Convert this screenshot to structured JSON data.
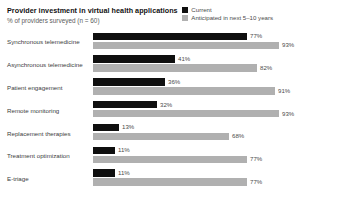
{
  "header": {
    "title": "Provider investment in virtual health applications",
    "subtitle": "% of providers surveyed (n = 60)"
  },
  "legend": {
    "items": [
      {
        "label": "Current",
        "color": "#0f0f0f",
        "swatch_name": "legend-swatch-current"
      },
      {
        "label": "Anticipated in next 5–10 years",
        "color": "#b0b0b0",
        "swatch_name": "legend-swatch-anticipated"
      }
    ]
  },
  "chart_data": {
    "type": "bar",
    "orientation": "horizontal",
    "title": "Provider investment in virtual health applications",
    "subtitle": "% of providers surveyed (n = 60)",
    "xlabel": "",
    "ylabel": "",
    "xlim": [
      0,
      100
    ],
    "grid": false,
    "legend_position": "top-right",
    "categories": [
      "Synchronous telemedicine",
      "Asynchronous telemedicine",
      "Patient engagement",
      "Remote monitoring",
      "Replacement therapies",
      "Treatment optimization",
      "E-triage"
    ],
    "series": [
      {
        "name": "Current",
        "color": "#0f0f0f",
        "values": [
          77,
          41,
          36,
          32,
          13,
          11,
          11
        ],
        "labels": [
          "77%",
          "41%",
          "36%",
          "32%",
          "13%",
          "11%",
          "11%"
        ]
      },
      {
        "name": "Anticipated in next 5–10 years",
        "color": "#b0b0b0",
        "values": [
          93,
          82,
          91,
          93,
          68,
          77,
          77
        ],
        "labels": [
          "93%",
          "82%",
          "91%",
          "93%",
          "68%",
          "77%",
          "77%"
        ]
      }
    ]
  }
}
